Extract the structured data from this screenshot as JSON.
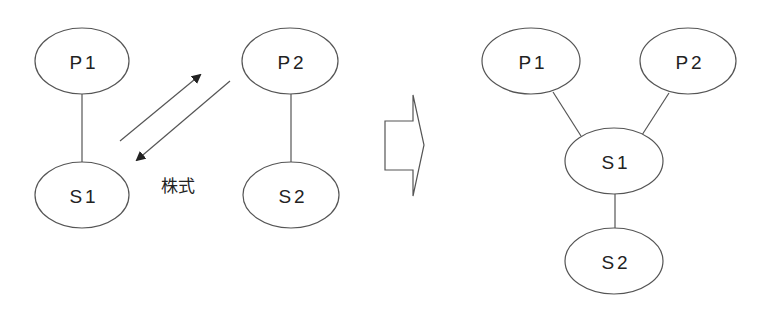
{
  "diagram": {
    "before": {
      "nodes": [
        {
          "id": "P1",
          "label": "P1"
        },
        {
          "id": "S1",
          "label": "S1"
        },
        {
          "id": "P2",
          "label": "P2"
        },
        {
          "id": "S2",
          "label": "S2"
        }
      ],
      "edges": [
        {
          "from": "P1",
          "to": "S1"
        },
        {
          "from": "P2",
          "to": "S2"
        }
      ],
      "exchange_label": "株式"
    },
    "after": {
      "nodes": [
        {
          "id": "P1",
          "label": "P1"
        },
        {
          "id": "P2",
          "label": "P2"
        },
        {
          "id": "S1",
          "label": "S1"
        },
        {
          "id": "S2",
          "label": "S2"
        }
      ],
      "edges": [
        {
          "from": "P1",
          "to": "S1"
        },
        {
          "from": "P2",
          "to": "S1"
        },
        {
          "from": "S1",
          "to": "S2"
        }
      ]
    },
    "colors": {
      "stroke": "#555555",
      "text": "#222222",
      "background": "#ffffff"
    }
  }
}
